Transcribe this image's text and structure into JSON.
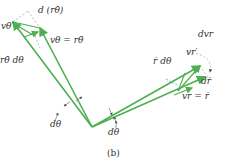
{
  "diagram": {
    "caption": "(b)",
    "colors": {
      "vector": "#4caf50",
      "dashed": "#9e9e9e",
      "arc": "#5aa0d8",
      "text": "#333333"
    },
    "labels": {
      "d_r_theta_dot": "d (rθ̇)",
      "v_theta_prime": "vθ′",
      "v_theta": "vθ = rθ̇",
      "r_theta_dot_dtheta": "rθ̇ dθ",
      "d_v_r": "dvr",
      "v_r_prime": "vr′",
      "r_dot_dtheta": "ṙ dθ",
      "d_r_dot": "dṙ",
      "v_r": "vr = ṙ",
      "dtheta_left": "dθ",
      "dtheta_bottom": "dθ"
    }
  }
}
